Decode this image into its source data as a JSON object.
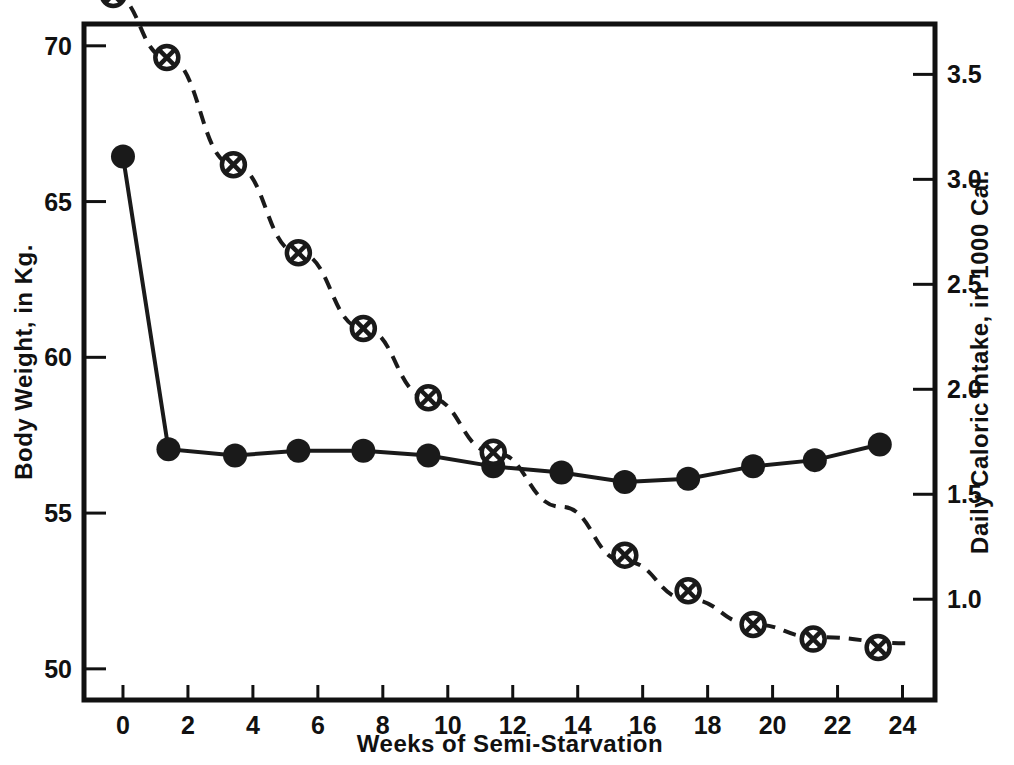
{
  "chart_data": {
    "type": "line",
    "title": "",
    "xlabel": "Weeks  of  Semi-Starvation",
    "ylabel": "Body Weight, in Kg.",
    "y2label": "Daily Caloric Intake, in 1000 Cal.",
    "xlim": [
      -1.2,
      25.0
    ],
    "ylim": [
      49.0,
      70.7
    ],
    "y2lim": [
      0.52,
      3.74
    ],
    "xticks": [
      0,
      2,
      4,
      6,
      8,
      10,
      12,
      14,
      16,
      18,
      20,
      22,
      24
    ],
    "xticklabels": [
      "0",
      "2",
      "4",
      "6",
      "8",
      "10",
      "12",
      "14",
      "16",
      "18",
      "20",
      "22",
      "24"
    ],
    "yticks": [
      50,
      55,
      60,
      65,
      70
    ],
    "yticklabels": [
      "50",
      "55",
      "60",
      "65",
      "70"
    ],
    "y2ticks": [
      1.0,
      1.5,
      2.0,
      2.5,
      3.0,
      3.5
    ],
    "y2ticklabels": [
      "1.0",
      "1.5",
      "2.0",
      "2.5",
      "3.0",
      "3.5"
    ],
    "grid": false,
    "legend": "none",
    "series": [
      {
        "name": "Body Weight",
        "axis": "left",
        "marker": "filled-circle",
        "linestyle": "solid",
        "color": "#1a1a1a",
        "points": [
          {
            "x": 0.0,
            "y": 66.45
          },
          {
            "x": 1.4,
            "y": 57.05
          },
          {
            "x": 3.45,
            "y": 56.85
          },
          {
            "x": 5.4,
            "y": 57.0
          },
          {
            "x": 7.4,
            "y": 57.0
          },
          {
            "x": 9.4,
            "y": 56.85
          },
          {
            "x": 11.4,
            "y": 56.5
          },
          {
            "x": 13.5,
            "y": 56.3
          },
          {
            "x": 15.45,
            "y": 56.0
          },
          {
            "x": 17.4,
            "y": 56.1
          },
          {
            "x": 19.4,
            "y": 56.5
          },
          {
            "x": 21.3,
            "y": 56.7
          },
          {
            "x": 23.3,
            "y": 57.2
          }
        ]
      },
      {
        "name": "Daily Caloric Intake",
        "axis": "right",
        "marker": "crossed-circle",
        "linestyle": "dashed",
        "color": "#1a1a1a",
        "points": [
          {
            "x": -0.3,
            "y": 3.88
          },
          {
            "x": 1.35,
            "y": 3.58
          },
          {
            "x": 3.4,
            "y": 3.07
          },
          {
            "x": 5.4,
            "y": 2.65
          },
          {
            "x": 7.4,
            "y": 2.29
          },
          {
            "x": 9.4,
            "y": 1.96
          },
          {
            "x": 11.4,
            "y": 1.7
          },
          {
            "x": 15.45,
            "y": 1.21
          },
          {
            "x": 17.4,
            "y": 1.04
          },
          {
            "x": 19.4,
            "y": 0.88
          },
          {
            "x": 21.25,
            "y": 0.81
          },
          {
            "x": 23.25,
            "y": 0.77
          }
        ],
        "curve_points": [
          {
            "x": -0.3,
            "y": 3.88
          },
          {
            "x": 1.35,
            "y": 3.58
          },
          {
            "x": 3.4,
            "y": 3.07
          },
          {
            "x": 5.4,
            "y": 2.65
          },
          {
            "x": 7.4,
            "y": 2.29
          },
          {
            "x": 9.4,
            "y": 1.96
          },
          {
            "x": 11.4,
            "y": 1.7
          },
          {
            "x": 13.5,
            "y": 1.44
          },
          {
            "x": 15.45,
            "y": 1.18
          },
          {
            "x": 17.4,
            "y": 1.0
          },
          {
            "x": 19.4,
            "y": 0.88
          },
          {
            "x": 21.3,
            "y": 0.82
          },
          {
            "x": 24.2,
            "y": 0.79
          }
        ]
      }
    ]
  }
}
